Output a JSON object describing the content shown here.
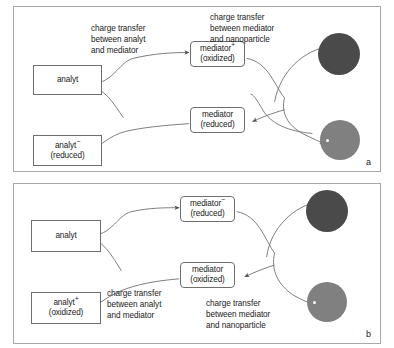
{
  "figure": {
    "type": "diagram",
    "panels": [
      {
        "letter": "a",
        "nodes": {
          "analyt": {
            "line1": "analyt",
            "line2": ""
          },
          "analyt_product": {
            "line1": "analyt",
            "charge": "−",
            "line2": "(reduced)"
          },
          "mediator_top": {
            "line1": "mediator",
            "charge": "+",
            "line2": "(oxidized)"
          },
          "mediator_bottom": {
            "line1": "mediator",
            "charge": "",
            "line2": "(reduced)"
          }
        },
        "captions": {
          "left": {
            "l1": "charge transfer",
            "l2": "between analyt",
            "l3": "and mediator"
          },
          "right": {
            "l1": "charge  transfer",
            "l2": "between mediator",
            "l3": "and nanoparticle"
          }
        },
        "particles": [
          {
            "name": "nanoparticle-dark",
            "shade": "dark"
          },
          {
            "name": "nanoparticle-light",
            "shade": "light"
          }
        ]
      },
      {
        "letter": "b",
        "nodes": {
          "analyt": {
            "line1": "analyt",
            "line2": ""
          },
          "analyt_product": {
            "line1": "analyt",
            "charge": "+",
            "line2": "(oxidized)"
          },
          "mediator_top": {
            "line1": "mediator",
            "charge": "−",
            "line2": "(reduced)"
          },
          "mediator_bottom": {
            "line1": "mediator",
            "charge": "",
            "line2": "(oxidized)"
          }
        },
        "captions": {
          "left": {
            "l1": "charge transfer",
            "l2": "between analyt",
            "l3": "and mediator"
          },
          "right": {
            "l1": "charge  transfer",
            "l2": "between mediator",
            "l3": "and nanoparticle"
          }
        },
        "particles": [
          {
            "name": "nanoparticle-dark",
            "shade": "dark"
          },
          {
            "name": "nanoparticle-light",
            "shade": "light"
          }
        ]
      }
    ],
    "colors": {
      "frame": "#a8a8a8",
      "box_border": "#6e6e6e",
      "arrow": "#6e6e6e",
      "particle_dark": "#4a4a4a",
      "particle_light": "#808080",
      "text": "#1a1a1a",
      "background": "#ffffff"
    }
  }
}
